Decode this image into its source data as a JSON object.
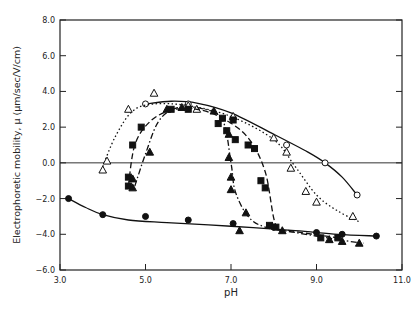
{
  "chart_data": {
    "type": "scatter",
    "title": "",
    "xlabel": "pH",
    "ylabel": "Electrophoretic mobility, μ (μm/sec/V/cm)",
    "xlim": [
      3.0,
      11.0
    ],
    "ylim": [
      -6.0,
      8.0
    ],
    "xticks": [
      3.0,
      5.0,
      7.0,
      9.0,
      11.0
    ],
    "xtick_labels": [
      "3.0",
      "5.0",
      "7.0",
      "9.0",
      "11.0"
    ],
    "yticks": [
      8.0,
      6.0,
      4.0,
      2.0,
      0.0,
      -2.0,
      -4.0,
      -6.0
    ],
    "ytick_labels": [
      "8.0",
      "6.0",
      "4.0",
      "2.0",
      "0.0",
      "-2.0",
      "-4.0",
      "-6.0"
    ],
    "grid": false,
    "zero_line": true,
    "legend": null,
    "series": [
      {
        "name": "open circles",
        "marker": "circle-open",
        "line": "solid",
        "points": [
          [
            5.0,
            3.3
          ],
          [
            6.0,
            3.3
          ],
          [
            8.3,
            1.0
          ],
          [
            9.2,
            0.0
          ],
          [
            9.95,
            -1.8
          ]
        ],
        "curve": [
          [
            5.0,
            3.3
          ],
          [
            5.6,
            3.45
          ],
          [
            6.2,
            3.35
          ],
          [
            7.0,
            2.8
          ],
          [
            8.0,
            1.6
          ],
          [
            8.8,
            0.6
          ],
          [
            9.2,
            0.0
          ],
          [
            9.6,
            -0.8
          ],
          [
            9.95,
            -1.8
          ]
        ]
      },
      {
        "name": "open triangles",
        "marker": "triangle-open",
        "line": "dotted",
        "points": [
          [
            4.0,
            -0.4
          ],
          [
            4.1,
            0.1
          ],
          [
            4.6,
            3.0
          ],
          [
            5.2,
            3.9
          ],
          [
            6.0,
            3.2
          ],
          [
            6.2,
            3.0
          ],
          [
            7.05,
            2.6
          ],
          [
            8.0,
            1.4
          ],
          [
            8.3,
            0.6
          ],
          [
            8.4,
            -0.3
          ],
          [
            8.75,
            -1.6
          ],
          [
            9.0,
            -2.2
          ],
          [
            9.85,
            -3.0
          ]
        ],
        "curve": [
          [
            4.0,
            -0.2
          ],
          [
            4.3,
            1.5
          ],
          [
            4.7,
            2.9
          ],
          [
            5.2,
            3.3
          ],
          [
            6.0,
            3.2
          ],
          [
            7.0,
            2.6
          ],
          [
            8.0,
            1.3
          ],
          [
            8.5,
            -0.2
          ],
          [
            9.0,
            -1.8
          ],
          [
            9.5,
            -2.7
          ],
          [
            10.0,
            -3.3
          ]
        ]
      },
      {
        "name": "filled squares",
        "marker": "square-filled",
        "line": "dashed",
        "points": [
          [
            4.6,
            -1.3
          ],
          [
            4.6,
            -0.8
          ],
          [
            4.7,
            1.0
          ],
          [
            4.9,
            2.0
          ],
          [
            5.6,
            3.0
          ],
          [
            6.0,
            3.0
          ],
          [
            6.7,
            2.2
          ],
          [
            6.8,
            2.5
          ],
          [
            6.9,
            1.8
          ],
          [
            7.05,
            2.4
          ],
          [
            7.1,
            1.3
          ],
          [
            7.4,
            1.0
          ],
          [
            7.55,
            0.8
          ],
          [
            7.7,
            -1.0
          ],
          [
            7.8,
            -1.4
          ],
          [
            7.9,
            -3.5
          ],
          [
            8.05,
            -3.6
          ],
          [
            9.1,
            -4.2
          ],
          [
            9.5,
            -4.2
          ]
        ],
        "curve": [
          [
            4.6,
            -1.3
          ],
          [
            4.75,
            1.0
          ],
          [
            5.1,
            2.3
          ],
          [
            5.6,
            2.95
          ],
          [
            6.2,
            3.0
          ],
          [
            6.8,
            2.5
          ],
          [
            7.4,
            1.4
          ],
          [
            7.8,
            -0.5
          ],
          [
            8.05,
            -3.5
          ],
          [
            8.4,
            -3.8
          ],
          [
            9.5,
            -4.2
          ]
        ]
      },
      {
        "name": "filled triangles",
        "marker": "triangle-filled",
        "line": "dash-dot",
        "points": [
          [
            4.7,
            -1.4
          ],
          [
            4.7,
            -0.9
          ],
          [
            5.1,
            0.6
          ],
          [
            5.5,
            3.0
          ],
          [
            5.85,
            3.1
          ],
          [
            6.6,
            2.9
          ],
          [
            6.95,
            1.6
          ],
          [
            6.95,
            0.3
          ],
          [
            7.0,
            -0.8
          ],
          [
            7.0,
            -1.5
          ],
          [
            7.35,
            -2.8
          ],
          [
            7.2,
            -3.8
          ],
          [
            8.2,
            -3.8
          ],
          [
            9.3,
            -4.3
          ],
          [
            9.6,
            -4.4
          ],
          [
            10.0,
            -4.5
          ]
        ],
        "curve": [
          [
            4.75,
            -1.3
          ],
          [
            5.0,
            0.5
          ],
          [
            5.3,
            2.3
          ],
          [
            5.7,
            3.05
          ],
          [
            6.3,
            3.05
          ],
          [
            6.8,
            2.4
          ],
          [
            7.0,
            0.0
          ],
          [
            7.1,
            -1.6
          ],
          [
            7.4,
            -3.0
          ],
          [
            7.8,
            -3.6
          ],
          [
            8.5,
            -3.9
          ],
          [
            9.5,
            -4.3
          ],
          [
            10.1,
            -4.5
          ]
        ]
      },
      {
        "name": "filled circles",
        "marker": "circle-filled",
        "line": "solid",
        "points": [
          [
            3.2,
            -2.0
          ],
          [
            4.0,
            -2.9
          ],
          [
            5.0,
            -3.0
          ],
          [
            6.0,
            -3.2
          ],
          [
            7.05,
            -3.4
          ],
          [
            8.0,
            -3.6
          ],
          [
            9.0,
            -3.9
          ],
          [
            9.6,
            -4.0
          ],
          [
            10.4,
            -4.1
          ]
        ],
        "curve": [
          [
            3.2,
            -2.0
          ],
          [
            3.6,
            -2.5
          ],
          [
            4.0,
            -2.9
          ],
          [
            4.6,
            -3.2
          ],
          [
            5.5,
            -3.35
          ],
          [
            7.0,
            -3.55
          ],
          [
            8.5,
            -3.8
          ],
          [
            9.5,
            -4.0
          ],
          [
            10.4,
            -4.1
          ]
        ]
      }
    ]
  }
}
